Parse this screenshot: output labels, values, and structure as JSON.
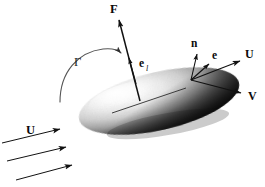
{
  "figure": {
    "background_color": "#ffffff",
    "width": 265,
    "height": 187,
    "ink_color": "#111111"
  },
  "labels": {
    "force": "F",
    "lift_unit_vector": "e",
    "lift_unit_vector_subscript": "l",
    "normal": "n",
    "unit_vector": "e",
    "velocity_upper": "U",
    "velocity_v": "V",
    "circulation": "Γ",
    "freestream": "U"
  },
  "vectors": [
    {
      "name": "force",
      "label": "F",
      "description": "resultant aerodynamic force, long arrow from body mid-chord pointing up and slightly left",
      "from": [
        140,
        100
      ],
      "to": [
        118,
        18
      ],
      "label_position": [
        113,
        12
      ]
    },
    {
      "name": "lift-unit-vector",
      "label": "e_l",
      "description": "unit vector in lift direction, short arrowhead midway along the force line",
      "from": [
        140,
        100
      ],
      "to": [
        128,
        57
      ],
      "label_position": [
        139,
        66
      ]
    },
    {
      "name": "surface-normal",
      "label": "n",
      "description": "outward surface normal at the upper-right point of the body",
      "from": [
        191,
        80
      ],
      "to": [
        198,
        52
      ],
      "label_position": [
        193,
        46
      ]
    },
    {
      "name": "unit-vector-e",
      "label": "e",
      "description": "unit tangent/direction vector from the same surface point",
      "from": [
        191,
        80
      ],
      "to": [
        211,
        62
      ],
      "label_position": [
        213,
        58
      ]
    },
    {
      "name": "velocity-U",
      "label": "U",
      "description": "local velocity vector pointing up-right",
      "from": [
        191,
        80
      ],
      "to": [
        243,
        60
      ],
      "label_position": [
        246,
        57
      ]
    },
    {
      "name": "velocity-V",
      "label": "V",
      "description": "velocity vector pointing down-right",
      "from": [
        191,
        80
      ],
      "to": [
        246,
        95
      ],
      "label_position": [
        250,
        99
      ]
    }
  ],
  "circulation": {
    "name": "circulation-arc",
    "label": "Γ",
    "description": "curved arrow over the upper-left of the body indicating bound circulation, sweeping clockwise to the right",
    "label_position": [
      76,
      62
    ]
  },
  "freestream": {
    "label": "U",
    "label_position": [
      30,
      131
    ],
    "description": "three parallel straight arrows in the lower-left representing the uniform oncoming stream",
    "arrows": [
      {
        "from": [
          2,
          143
        ],
        "to": [
          64,
          128
        ]
      },
      {
        "from": [
          7,
          161
        ],
        "to": [
          70,
          146
        ]
      },
      {
        "from": [
          16,
          180
        ],
        "to": [
          76,
          164
        ]
      }
    ]
  },
  "body": {
    "name": "lifting-body",
    "description": "shaded lens/ellipsoid-shaped three-dimensional body, bright highlight at upper-left fading to deep black at the lower-right",
    "center": [
      159,
      101
    ],
    "radius_x": 82,
    "radius_y": 29,
    "rotation_degrees": -13,
    "highlight_color": "#f7f7f7",
    "mid_color": "#9a9a9a",
    "shadow_color": "#0d0d0d"
  },
  "chord": {
    "name": "chord-line",
    "description": "thin straight line across the top surface of the body through the force application point",
    "from": [
      112,
      113
    ],
    "to": [
      186,
      88
    ]
  }
}
